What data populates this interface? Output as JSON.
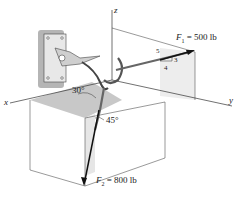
{
  "diagram": {
    "axes": {
      "x": "x",
      "y": "y",
      "z": "z"
    },
    "forces": [
      {
        "name": "F",
        "subscript": "1",
        "value_text": "= 500 lb"
      },
      {
        "name": "F",
        "subscript": "2",
        "value_text": "= 800 lb"
      }
    ],
    "slope_triangle": {
      "hypotenuse": "5",
      "rise": "3",
      "run": "4"
    },
    "angles": {
      "a30": "30°",
      "a45": "45°"
    },
    "colors": {
      "line": "#333333",
      "shade": "#d9d9d9",
      "plate": "#bdbdbd",
      "arrow": "#111111"
    }
  }
}
